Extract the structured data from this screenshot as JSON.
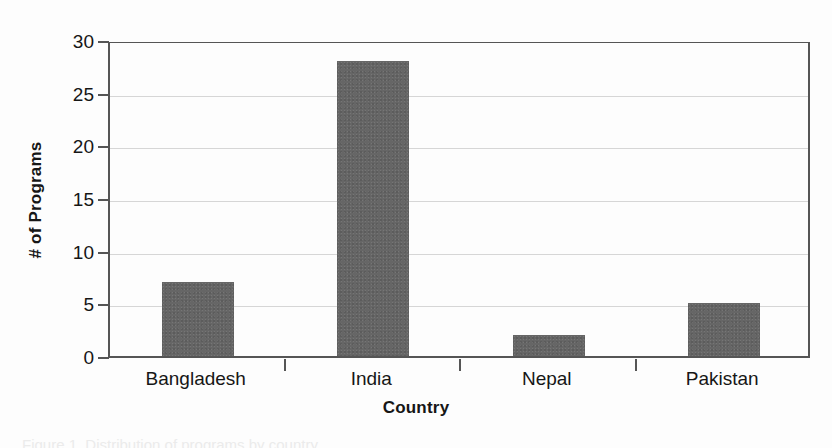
{
  "chart_data": {
    "type": "bar",
    "title": "",
    "xlabel": "Country",
    "ylabel": "# of Programs",
    "categories": [
      "Bangladesh",
      "India",
      "Nepal",
      "Pakistan"
    ],
    "values": [
      7,
      28,
      2,
      5
    ],
    "ylim": [
      0,
      30
    ],
    "ytick_labels": [
      "0",
      "5",
      "10",
      "15",
      "20",
      "25",
      "30"
    ],
    "ytick_values": [
      0,
      5,
      10,
      15,
      20,
      25,
      30
    ],
    "grid": "horizontal",
    "legend": "none",
    "bar_color": "#666666",
    "axis_color": "#555555",
    "gridline_color": "#d6d6d6",
    "background_color": "#fdfdfd"
  },
  "caption": {
    "text": "Figure 1. Distribution of programs by country"
  }
}
